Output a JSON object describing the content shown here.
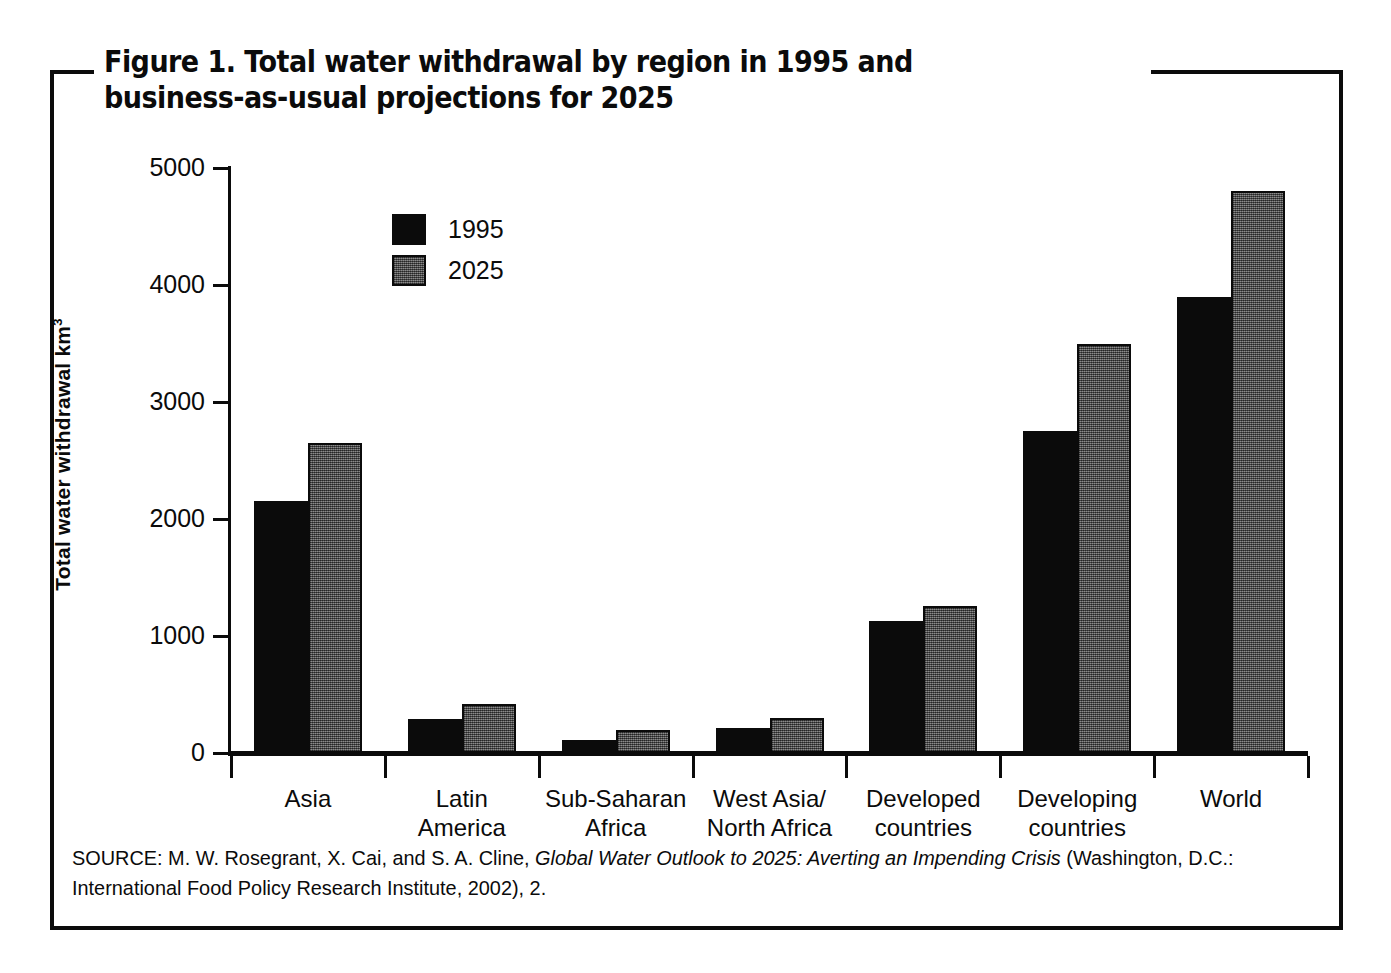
{
  "figure": {
    "title": "Figure 1. Total water withdrawal by region in 1995 and business-as-usual projections for 2025",
    "source_prefix": "SOURCE: M. W. Rosegrant, X. Cai, and S. A. Cline, ",
    "source_italic": "Global Water Outlook to 2025: Averting an Impending Crisis",
    "source_suffix": " (Washington, D.C.: International Food Policy Research Institute, 2002), 2."
  },
  "legend": {
    "items": [
      {
        "label": "1995",
        "color": "#0b0b0b"
      },
      {
        "label": "2025",
        "color": "#5b5b5b"
      }
    ]
  },
  "axes": {
    "y_title_text": "Total water withdrawal km",
    "y_title_sup": "3",
    "y_ticks": [
      "0",
      "1000",
      "2000",
      "3000",
      "4000",
      "5000"
    ]
  },
  "chart_data": {
    "type": "bar",
    "title": "Figure 1. Total water withdrawal by region in 1995 and business-as-usual projections for 2025",
    "xlabel": "",
    "ylabel": "Total water withdrawal km3",
    "ylim": [
      0,
      5000
    ],
    "ytick_interval": 1000,
    "grid": false,
    "legend_position": "upper-left-inside",
    "categories": [
      "Asia",
      "Latin America",
      "Sub-Saharan Africa",
      "West Asia/North Africa",
      "Developed countries",
      "Developing countries",
      "World"
    ],
    "category_labels_line1": [
      "Asia",
      "Latin",
      "Sub-Saharan",
      "West Asia/",
      "Developed",
      "Developing",
      "World"
    ],
    "category_labels_line2": [
      "",
      "America",
      "Africa",
      "North Africa",
      "countries",
      "countries",
      ""
    ],
    "series": [
      {
        "name": "1995",
        "color": "#0b0b0b",
        "values": [
          2150,
          290,
          110,
          215,
          1130,
          2750,
          3900
        ]
      },
      {
        "name": "2025",
        "color": "#5b5b5b",
        "values": [
          2650,
          420,
          195,
          300,
          1260,
          3500,
          4800
        ]
      }
    ]
  }
}
